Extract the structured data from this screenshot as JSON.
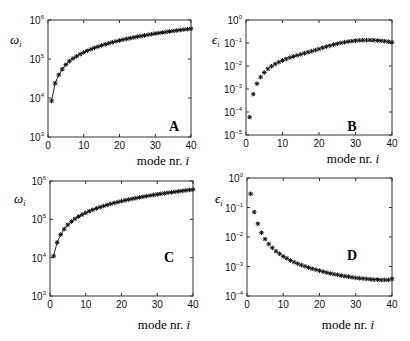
{
  "chart_data": [
    {
      "panel": "A",
      "type": "line",
      "title": "",
      "panel_label": "A",
      "xlabel": "mode nr. i",
      "ylabel": "ω_i",
      "yscale": "log",
      "xlim": [
        0,
        40
      ],
      "ylim": [
        1000,
        1000000
      ],
      "xticks": [
        0,
        10,
        20,
        30,
        40
      ],
      "yticks": [
        "10^3",
        "10^4",
        "10^5",
        "10^6"
      ],
      "grid": false,
      "legend": null,
      "series": [
        {
          "name": "omega",
          "marker": "asterisk",
          "line": true,
          "x": [
            1,
            2,
            3,
            4,
            5,
            6,
            7,
            8,
            9,
            10,
            11,
            12,
            13,
            14,
            15,
            16,
            17,
            18,
            19,
            20,
            21,
            22,
            23,
            24,
            25,
            26,
            27,
            28,
            29,
            30,
            31,
            32,
            33,
            34,
            35,
            36,
            37,
            38,
            39,
            40
          ],
          "values": [
            8400,
            24000,
            39000,
            55000,
            72000,
            88000,
            103000,
            118000,
            133000,
            148000,
            163000,
            178000,
            193000,
            208000,
            223000,
            238000,
            253000,
            268000,
            283000,
            298000,
            313000,
            328000,
            343000,
            358000,
            373000,
            388000,
            403000,
            418000,
            433000,
            448000,
            463000,
            478000,
            493000,
            508000,
            523000,
            538000,
            553000,
            568000,
            583000,
            598000
          ]
        }
      ]
    },
    {
      "panel": "B",
      "type": "scatter",
      "title": "",
      "panel_label": "B",
      "xlabel": "mode nr. i",
      "ylabel": "ε_i",
      "yscale": "log",
      "xlim": [
        0,
        40
      ],
      "ylim": [
        1e-05,
        1
      ],
      "xticks": [
        0,
        10,
        20,
        30,
        40
      ],
      "yticks": [
        "10^-5",
        "10^-4",
        "10^-3",
        "10^-2",
        "10^-1",
        "10^0"
      ],
      "grid": false,
      "legend": null,
      "series": [
        {
          "name": "epsilon",
          "marker": "asterisk",
          "line": false,
          "x": [
            1,
            2,
            3,
            4,
            5,
            6,
            7,
            8,
            9,
            10,
            11,
            12,
            13,
            14,
            15,
            16,
            17,
            18,
            19,
            20,
            21,
            22,
            23,
            24,
            25,
            26,
            27,
            28,
            29,
            30,
            31,
            32,
            33,
            34,
            35,
            36,
            37,
            38,
            39,
            40
          ],
          "values": [
            6e-05,
            0.0006,
            0.0017,
            0.0033,
            0.0052,
            0.0075,
            0.0098,
            0.0122,
            0.0148,
            0.0175,
            0.0203,
            0.0232,
            0.026,
            0.029,
            0.032,
            0.036,
            0.04,
            0.044,
            0.049,
            0.055,
            0.062,
            0.069,
            0.077,
            0.085,
            0.093,
            0.101,
            0.108,
            0.115,
            0.121,
            0.126,
            0.13,
            0.132,
            0.133,
            0.133,
            0.132,
            0.129,
            0.125,
            0.12,
            0.114,
            0.107
          ]
        }
      ]
    },
    {
      "panel": "C",
      "type": "line",
      "title": "",
      "panel_label": "C",
      "xlabel": "mode nr. i",
      "ylabel": "ω_i",
      "yscale": "log",
      "xlim": [
        0,
        40
      ],
      "ylim": [
        1000,
        1000000
      ],
      "xticks": [
        0,
        10,
        20,
        30,
        40
      ],
      "yticks": [
        "10^3",
        "10^4",
        "10^5",
        "10^6"
      ],
      "grid": false,
      "legend": null,
      "series": [
        {
          "name": "omega",
          "marker": "asterisk",
          "line": true,
          "x": [
            1,
            2,
            3,
            4,
            5,
            6,
            7,
            8,
            9,
            10,
            11,
            12,
            13,
            14,
            15,
            16,
            17,
            18,
            19,
            20,
            21,
            22,
            23,
            24,
            25,
            26,
            27,
            28,
            29,
            30,
            31,
            32,
            33,
            34,
            35,
            36,
            37,
            38,
            39,
            40
          ],
          "values": [
            11000,
            25000,
            40000,
            56000,
            72000,
            88000,
            103000,
            118000,
            133000,
            148000,
            163000,
            178000,
            193000,
            208000,
            223000,
            238000,
            253000,
            268000,
            283000,
            298000,
            313000,
            328000,
            343000,
            358000,
            373000,
            388000,
            403000,
            418000,
            433000,
            448000,
            463000,
            478000,
            493000,
            508000,
            523000,
            538000,
            553000,
            568000,
            583000,
            598000
          ]
        }
      ]
    },
    {
      "panel": "D",
      "type": "scatter",
      "title": "",
      "panel_label": "D",
      "xlabel": "mode nr. i",
      "ylabel": "ε_i",
      "yscale": "log",
      "xlim": [
        0,
        40
      ],
      "ylim": [
        0.0001,
        1
      ],
      "xticks": [
        0,
        10,
        20,
        30,
        40
      ],
      "yticks": [
        "10^-4",
        "10^-3",
        "10^-2",
        "10^-1",
        "10^0"
      ],
      "grid": false,
      "legend": null,
      "series": [
        {
          "name": "epsilon",
          "marker": "asterisk",
          "line": false,
          "x": [
            1,
            2,
            3,
            4,
            5,
            6,
            7,
            8,
            9,
            10,
            11,
            12,
            13,
            14,
            15,
            16,
            17,
            18,
            19,
            20,
            21,
            22,
            23,
            24,
            25,
            26,
            27,
            28,
            29,
            30,
            31,
            32,
            33,
            34,
            35,
            36,
            37,
            38,
            39,
            40
          ],
          "values": [
            0.29,
            0.07,
            0.028,
            0.014,
            0.0085,
            0.0058,
            0.0043,
            0.0033,
            0.0027,
            0.0022,
            0.0019,
            0.0016,
            0.0014,
            0.00125,
            0.00112,
            0.00101,
            0.00092,
            0.00084,
            0.00078,
            0.00072,
            0.00067,
            0.00062,
            0.00058,
            0.00055,
            0.00052,
            0.00049,
            0.00047,
            0.00045,
            0.00043,
            0.00041,
            0.0004,
            0.00039,
            0.00038,
            0.00037,
            0.00036,
            0.00036,
            0.00035,
            0.00035,
            0.00035,
            0.00038
          ]
        }
      ]
    }
  ],
  "panels": {
    "A": {
      "label": "A",
      "ylabel_sym": "ω",
      "ylabel_sub": "i",
      "xlabel_text": "mode nr. ",
      "xlabel_var": "i"
    },
    "B": {
      "label": "B",
      "ylabel_sym": "ϵ",
      "ylabel_sub": "i",
      "xlabel_text": "mode nr. ",
      "xlabel_var": "i"
    },
    "C": {
      "label": "C",
      "ylabel_sym": "ω",
      "ylabel_sub": "i",
      "xlabel_text": "mode nr. ",
      "xlabel_var": "i"
    },
    "D": {
      "label": "D",
      "ylabel_sym": "ϵ",
      "ylabel_sub": "i",
      "xlabel_text": "mode nr. ",
      "xlabel_var": "i"
    }
  }
}
